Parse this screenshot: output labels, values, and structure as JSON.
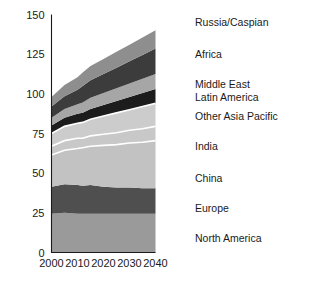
{
  "chart_data": {
    "type": "area",
    "title": "",
    "xlabel": "",
    "ylabel": "",
    "stacked": true,
    "grid": false,
    "legend_position": "right",
    "xlim": [
      2000,
      2040
    ],
    "ylim": [
      0,
      150
    ],
    "x_ticks": [
      2000,
      2010,
      2020,
      2030,
      2040
    ],
    "x_tick_labels": [
      "2000",
      "2010",
      "2020",
      "2030",
      "2040"
    ],
    "y_ticks": [
      0,
      25,
      50,
      75,
      100,
      125,
      150
    ],
    "y_tick_labels": [
      "0",
      "25",
      "50",
      "75",
      "100",
      "125",
      "150"
    ],
    "x": [
      2000,
      2005,
      2010,
      2012,
      2015,
      2020,
      2025,
      2030,
      2035,
      2040
    ],
    "series": [
      {
        "name": "North America",
        "color": "#9a9a9a",
        "values": [
          24.5,
          25.0,
          24.5,
          24.5,
          24.5,
          24.5,
          24.5,
          24.5,
          24.5,
          24.5
        ]
      },
      {
        "name": "Europe",
        "color": "#4f4f4f",
        "values": [
          17.0,
          18.0,
          18.0,
          17.5,
          18.0,
          17.0,
          16.5,
          16.5,
          16.0,
          16.0
        ]
      },
      {
        "name": "China",
        "color": "#c2c2c2",
        "values": [
          20.0,
          21.5,
          23.0,
          24.0,
          24.5,
          26.0,
          27.0,
          28.0,
          29.0,
          30.0
        ]
      },
      {
        "name": "India",
        "color": "#c8c8c8",
        "values": [
          5.5,
          6.0,
          6.5,
          6.0,
          6.5,
          7.0,
          7.5,
          8.0,
          8.5,
          9.0
        ]
      },
      {
        "name": "Other Asia Pacific",
        "color": "#cccccc",
        "values": [
          8.0,
          9.0,
          9.5,
          10.0,
          10.5,
          11.5,
          12.5,
          13.0,
          14.0,
          14.5
        ]
      },
      {
        "name": "Latin America",
        "color": "#1c1c1c",
        "values": [
          5.0,
          5.5,
          6.0,
          6.0,
          6.5,
          7.0,
          7.5,
          8.0,
          8.5,
          9.0
        ]
      },
      {
        "name": "Middle East",
        "color": "#a6a6a6",
        "values": [
          5.0,
          5.5,
          6.0,
          6.5,
          7.0,
          7.5,
          8.0,
          8.5,
          9.0,
          9.5
        ]
      },
      {
        "name": "Africa",
        "color": "#3c3c3c",
        "values": [
          7.0,
          8.0,
          9.0,
          10.5,
          11.0,
          12.0,
          13.0,
          14.0,
          15.0,
          16.0
        ]
      },
      {
        "name": "Russia/Caspian",
        "color": "#8e8e8e",
        "values": [
          6.0,
          7.0,
          8.0,
          8.5,
          9.0,
          9.5,
          10.0,
          10.5,
          11.0,
          11.5
        ]
      }
    ],
    "totals": [
      98.0,
      105.5,
      110.5,
      113.5,
      117.5,
      122.0,
      126.5,
      130.0,
      135.5,
      140.0
    ]
  },
  "axis": {
    "y_tick_labels": [
      "150",
      "125",
      "100",
      "75",
      "50",
      "25",
      "0"
    ],
    "x_tick_labels": [
      "2000",
      "2010",
      "2020",
      "2030",
      "2040"
    ]
  },
  "legend": {
    "items": [
      {
        "label": "Russia/Caspian"
      },
      {
        "label": "Africa"
      },
      {
        "label": "Middle East"
      },
      {
        "label": "Latin America"
      },
      {
        "label": "Other Asia Pacific"
      },
      {
        "label": "India"
      },
      {
        "label": "China"
      },
      {
        "label": "Europe"
      },
      {
        "label": "North America"
      }
    ]
  }
}
